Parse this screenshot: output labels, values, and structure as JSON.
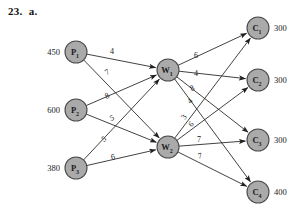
{
  "problem": {
    "number": "23.",
    "part": "a."
  },
  "diagram": {
    "type": "transshipment-network",
    "nodes": {
      "plants": [
        {
          "id": "P1",
          "letter": "P",
          "index": "1",
          "supply": "450",
          "x": 76,
          "y": 52
        },
        {
          "id": "P2",
          "letter": "P",
          "index": "2",
          "supply": "600",
          "x": 76,
          "y": 110
        },
        {
          "id": "P3",
          "letter": "P",
          "index": "3",
          "supply": "380",
          "x": 76,
          "y": 168
        }
      ],
      "warehouses": [
        {
          "id": "W1",
          "letter": "W",
          "index": "1",
          "x": 168,
          "y": 70
        },
        {
          "id": "W2",
          "letter": "W",
          "index": "2",
          "x": 168,
          "y": 147
        }
      ],
      "customers": [
        {
          "id": "C1",
          "letter": "C",
          "index": "1",
          "demand": "300",
          "x": 258,
          "y": 28
        },
        {
          "id": "C2",
          "letter": "C",
          "index": "2",
          "demand": "300",
          "x": 258,
          "y": 80
        },
        {
          "id": "C3",
          "letter": "C",
          "index": "3",
          "demand": "300",
          "x": 258,
          "y": 140
        },
        {
          "id": "C4",
          "letter": "C",
          "index": "4",
          "demand": "400",
          "x": 258,
          "y": 192
        }
      ]
    },
    "edges": [
      {
        "from": "P1",
        "to": "W1",
        "cost": "4",
        "lx": 112,
        "ly": 51,
        "rot": 0
      },
      {
        "from": "P1",
        "to": "W2",
        "cost": "7",
        "lx": 107,
        "ly": 72,
        "rot": -32
      },
      {
        "from": "P2",
        "to": "W1",
        "cost": "8",
        "lx": 107,
        "ly": 96,
        "rot": -24
      },
      {
        "from": "P2",
        "to": "W2",
        "cost": "5",
        "lx": 112,
        "ly": 118,
        "rot": -22
      },
      {
        "from": "P3",
        "to": "W1",
        "cost": "5",
        "lx": 104,
        "ly": 139,
        "rot": -36
      },
      {
        "from": "P3",
        "to": "W2",
        "cost": "6",
        "lx": 113,
        "ly": 157,
        "rot": -12
      },
      {
        "from": "W1",
        "to": "C1",
        "cost": "6",
        "lx": 196,
        "ly": 55,
        "rot": 0
      },
      {
        "from": "W1",
        "to": "C2",
        "cost": "4",
        "lx": 196,
        "ly": 73,
        "rot": 0
      },
      {
        "from": "W1",
        "to": "C3",
        "cost": "8",
        "lx": 192,
        "ly": 88,
        "rot": -28
      },
      {
        "from": "W1",
        "to": "C4",
        "cost": "4",
        "lx": 190,
        "ly": 101,
        "rot": -44
      },
      {
        "from": "W2",
        "to": "C1",
        "cost": "3",
        "lx": 184,
        "ly": 117,
        "rot": -56
      },
      {
        "from": "W2",
        "to": "C2",
        "cost": "6",
        "lx": 191,
        "ly": 124,
        "rot": -46
      },
      {
        "from": "W2",
        "to": "C3",
        "cost": "7",
        "lx": 199,
        "ly": 139,
        "rot": 0
      },
      {
        "from": "W2",
        "to": "C4",
        "cost": "7",
        "lx": 200,
        "ly": 156,
        "rot": -12
      }
    ],
    "node_radius": 11,
    "colors": {
      "node_fill": "#aaaaaa",
      "node_stroke": "#4a4a4a",
      "edge": "#202020",
      "text": "#1a1a1a",
      "background": "#ffffff"
    }
  }
}
